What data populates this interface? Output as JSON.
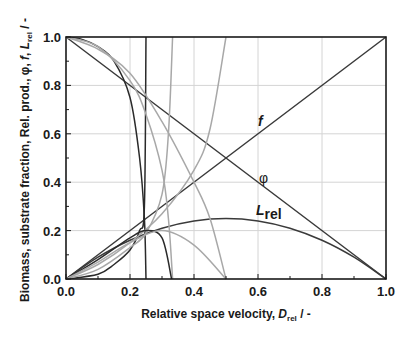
{
  "chart_data": {
    "type": "line",
    "title": "",
    "xlabel": "Relative space velocity, D_rel / -",
    "xlabel_parts": {
      "main": "Relative space velocity, ",
      "symbol": "D",
      "sub": "rel",
      "suffix": " / -"
    },
    "ylabel": "Biomass, substrate fraction, Rel. prod., φ, f, L_rel / -",
    "ylabel_parts": {
      "main": "Biomass, substrate fraction, Rel. prod., φ, ",
      "f": "f",
      "sep": ", ",
      "symbol": "L",
      "sub": "rel",
      "suffix": " / -"
    },
    "xlim": [
      0.0,
      1.0
    ],
    "ylim": [
      0.0,
      1.0
    ],
    "x_ticks": [
      "0.0",
      "0.2",
      "0.4",
      "0.6",
      "0.8",
      "1.0"
    ],
    "y_ticks": [
      "0.0",
      "0.2",
      "0.4",
      "0.6",
      "0.8",
      "1.0"
    ],
    "grid": true,
    "legend": "none (inline labels)",
    "annotations": [
      {
        "text": "f",
        "x": 0.61,
        "y": 0.65,
        "style": "bold italic"
      },
      {
        "text": "φ",
        "x": 0.61,
        "y": 0.41
      },
      {
        "text": "L",
        "sub": "rel",
        "x": 0.62,
        "y": 0.27,
        "style": "bold italic"
      }
    ],
    "series": [
      {
        "name": "f",
        "color": "#3a3a3a",
        "x": [
          0.0,
          1.0
        ],
        "y": [
          0.0,
          1.0
        ]
      },
      {
        "name": "φ",
        "color": "#3a3a3a",
        "x": [
          0.0,
          1.0
        ],
        "y": [
          1.0,
          0.0
        ]
      },
      {
        "name": "L_rel",
        "color": "#3a3a3a",
        "x": [
          0.0,
          0.1,
          0.2,
          0.3,
          0.4,
          0.5,
          0.6,
          0.7,
          0.8,
          0.9,
          1.0
        ],
        "y": [
          0.0,
          0.09,
          0.16,
          0.21,
          0.24,
          0.25,
          0.24,
          0.21,
          0.16,
          0.09,
          0.0
        ]
      },
      {
        "name": "substrate fraction (Dmax=0.25)",
        "color": "#2a2a2a",
        "x": [
          0.0,
          0.05,
          0.1,
          0.15,
          0.2,
          0.23,
          0.245,
          0.25
        ],
        "y": [
          1.0,
          0.99,
          0.96,
          0.9,
          0.75,
          0.5,
          0.25,
          0.0
        ]
      },
      {
        "name": "biomass (Dmax=0.25)",
        "color": "#2a2a2a",
        "x": [
          0.0,
          0.1,
          0.15,
          0.2,
          0.23,
          0.245,
          0.25
        ],
        "y": [
          0.0,
          0.02,
          0.06,
          0.12,
          0.2,
          0.3,
          1.0
        ]
      },
      {
        "name": "substrate fraction (Dmax=0.333)",
        "color": "#a8a8a8",
        "x": [
          0.0,
          0.1,
          0.2,
          0.25,
          0.3,
          0.32,
          0.333
        ],
        "y": [
          1.0,
          0.96,
          0.82,
          0.68,
          0.45,
          0.25,
          0.0
        ]
      },
      {
        "name": "biomass (Dmax=0.333)",
        "color": "#a8a8a8",
        "x": [
          0.0,
          0.1,
          0.2,
          0.25,
          0.3,
          0.32,
          0.333
        ],
        "y": [
          0.0,
          0.04,
          0.13,
          0.19,
          0.35,
          0.6,
          1.0
        ]
      },
      {
        "name": "substrate fraction (Dmax=0.5)",
        "color": "#a8a8a8",
        "x": [
          0.0,
          0.1,
          0.2,
          0.3,
          0.4,
          0.45,
          0.5
        ],
        "y": [
          1.0,
          0.95,
          0.85,
          0.65,
          0.4,
          0.25,
          0.0
        ]
      },
      {
        "name": "biomass (Dmax=0.5)",
        "color": "#a8a8a8",
        "x": [
          0.0,
          0.1,
          0.2,
          0.3,
          0.4,
          0.45,
          0.5
        ],
        "y": [
          0.0,
          0.06,
          0.15,
          0.27,
          0.45,
          0.62,
          1.0
        ]
      },
      {
        "name": "rel. prod. (Dmax=0.25)",
        "color": "#2a2a2a",
        "x": [
          0.0,
          0.1,
          0.2,
          0.25,
          0.3,
          0.33
        ],
        "y": [
          0.0,
          0.08,
          0.17,
          0.2,
          0.17,
          0.0
        ]
      },
      {
        "name": "rel. prod. (Dmax=0.5)",
        "color": "#a8a8a8",
        "x": [
          0.0,
          0.1,
          0.2,
          0.3,
          0.4,
          0.5
        ],
        "y": [
          0.0,
          0.07,
          0.15,
          0.2,
          0.14,
          0.0
        ]
      }
    ]
  }
}
